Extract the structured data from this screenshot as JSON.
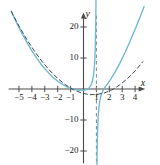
{
  "figure": {
    "axis_label_x": "x",
    "axis_label_y": "y",
    "colors": {
      "curve": "#6FB7D4",
      "asymptote_curve": "#3A4A52",
      "vertical_asymptote": "#7A8A92",
      "axis": "#4A4A4A",
      "text": "#1a1a1a",
      "background": "#ffffff"
    }
  },
  "chart_data": {
    "type": "line",
    "title": "",
    "xlabel": "x",
    "ylabel": "y",
    "xlim": [
      -5.8,
      4.9
    ],
    "ylim": [
      -24,
      25
    ],
    "grid": false,
    "legend": "none",
    "x_ticks": [
      -5,
      -4,
      -3,
      -2,
      -1,
      1,
      2,
      3,
      4
    ],
    "x_tick_labels": [
      "-5",
      "-4",
      "-3",
      "-2",
      "-1",
      "1",
      "2",
      "3",
      "4"
    ],
    "y_ticks": [
      -20,
      -10,
      10,
      20
    ],
    "y_tick_labels": [
      "-20",
      "-10",
      "10",
      "20"
    ],
    "annotations": [
      {
        "type": "vertical-asymptote",
        "x": 1,
        "style": "dashed",
        "label": ""
      }
    ],
    "series": [
      {
        "name": "rational-function",
        "style": "solid",
        "color": "#6FB7D4",
        "branches": [
          {
            "name": "left-branch",
            "x": [
              -5.6,
              -5.2,
              -4.8,
              -4.4,
              -4.0,
              -3.6,
              -3.2,
              -2.8,
              -2.4,
              -2.0,
              -1.6,
              -1.2,
              -0.8,
              -0.4,
              0.0,
              0.2,
              0.4,
              0.55,
              0.68,
              0.78,
              0.86,
              0.91,
              0.945,
              0.965,
              0.978
            ],
            "y": [
              25.1,
              21.5,
              18.2,
              15.1,
              12.3,
              9.8,
              7.5,
              5.6,
              3.9,
              2.5,
              1.4,
              0.55,
              -0.04,
              -0.37,
              -0.4,
              -0.25,
              0.2,
              1.0,
              2.4,
              4.5,
              8.1,
              13.0,
              20.0,
              27.0,
              35.0
            ]
          },
          {
            "name": "right-branch",
            "x": [
              1.022,
              1.04,
              1.06,
              1.09,
              1.14,
              1.22,
              1.34,
              1.5,
              1.7,
              1.9,
              2.1,
              2.4,
              2.8,
              3.2,
              3.6,
              4.0,
              4.4,
              4.7
            ],
            "y": [
              -36.0,
              -26.0,
              -19.0,
              -13.5,
              -8.8,
              -5.0,
              -2.3,
              -0.6,
              0.75,
              1.9,
              3.1,
              5.1,
              8.2,
              11.6,
              15.3,
              19.3,
              23.4,
              26.6
            ]
          }
        ]
      },
      {
        "name": "asymptote-curve",
        "style": "dashed",
        "color": "#3A4A52",
        "branches": [
          {
            "name": "asymptote-parabola",
            "x": [
              -5.6,
              -5.0,
              -4.4,
              -3.8,
              -3.2,
              -2.6,
              -2.0,
              -1.4,
              -0.8,
              -0.2,
              0.4,
              1.0,
              1.6,
              2.2,
              2.8,
              3.4,
              4.0,
              4.6
            ],
            "y": [
              25.0,
              20.3,
              16.0,
              12.2,
              8.8,
              5.9,
              3.4,
              1.4,
              -0.2,
              -1.2,
              -1.8,
              -1.8,
              -1.3,
              -0.3,
              1.3,
              3.3,
              5.8,
              8.8
            ]
          }
        ]
      }
    ]
  }
}
